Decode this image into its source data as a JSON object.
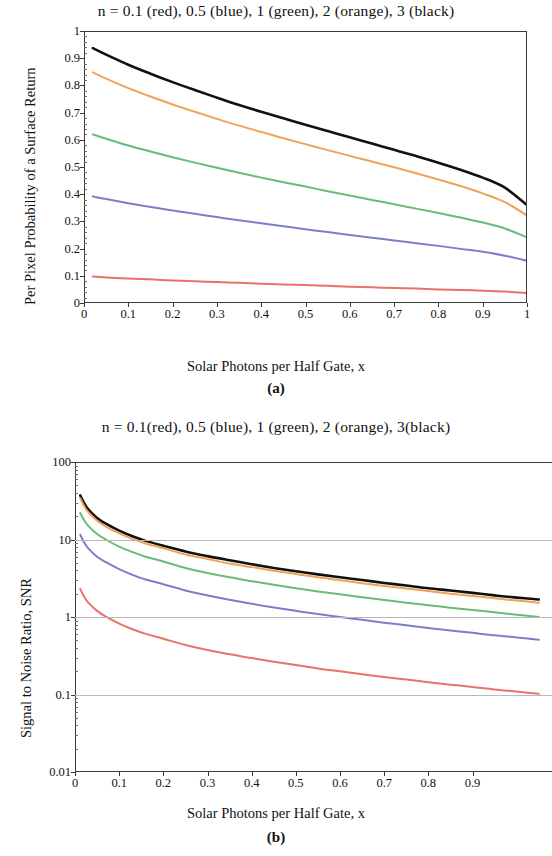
{
  "figure": {
    "panel_a": {
      "title": "n = 0.1 (red), 0.5 (blue), 1 (green), 2 (orange), 3 (black)",
      "ylabel": "Per Pixel Probability of a Surface Return",
      "xlabel": "Solar Photons per Half Gate, x",
      "caption": "(a)"
    },
    "panel_b": {
      "title": "n = 0.1(red), 0.5 (blue), 1 (green), 2 (orange), 3(black)",
      "ylabel": "Signal to Noise Ratio, SNR",
      "xlabel": "Solar Photons per Half Gate, x",
      "caption": "(b)"
    }
  },
  "colors": {
    "red": "#e8736a",
    "blue": "#7b7fc9",
    "green": "#6aba7a",
    "orange": "#f0a259",
    "black": "#111111",
    "axis": "#3a3a3a",
    "grid": "#b9b9b9"
  },
  "chart_data": [
    {
      "id": "panel-a",
      "type": "line",
      "title": "n = 0.1 (red), 0.5 (blue), 1 (green), 2 (orange), 3 (black)",
      "xlabel": "Solar Photons per Half Gate, x",
      "ylabel": "Per Pixel Probability of a Surface Return",
      "xlim": [
        0,
        1
      ],
      "ylim": [
        0,
        1
      ],
      "xscale": "linear",
      "yscale": "linear",
      "grid": false,
      "legend_position": "title",
      "xticks": [
        0,
        0.1,
        0.2,
        0.3,
        0.4,
        0.5,
        0.6,
        0.7,
        0.8,
        0.9,
        1
      ],
      "xticklabels": [
        "0",
        "0.1",
        "0.2",
        "0.3",
        "0.4",
        "0.5",
        "0.6",
        "0.7",
        "0.8",
        "0.9",
        "1"
      ],
      "yticks": [
        0,
        0.1,
        0.2,
        0.3,
        0.4,
        0.5,
        0.6,
        0.7,
        0.8,
        0.9,
        1
      ],
      "yticklabels": [
        "0",
        "0.1",
        "0.2",
        "0.3",
        "0.4",
        "0.5",
        "0.6",
        "0.7",
        "0.8",
        "0.9",
        "1"
      ],
      "x": [
        0.02,
        0.05,
        0.1,
        0.15,
        0.2,
        0.25,
        0.3,
        0.35,
        0.4,
        0.45,
        0.5,
        0.55,
        0.6,
        0.65,
        0.7,
        0.75,
        0.8,
        0.85,
        0.9,
        0.95,
        1.0
      ],
      "series": [
        {
          "name": "n = 3 (black)",
          "color": "#111111",
          "values": [
            0.937,
            0.913,
            0.876,
            0.843,
            0.812,
            0.783,
            0.755,
            0.728,
            0.703,
            0.679,
            0.655,
            0.632,
            0.609,
            0.586,
            0.563,
            0.54,
            0.516,
            0.49,
            0.461,
            0.424,
            0.36
          ]
        },
        {
          "name": "n = 2 (orange)",
          "color": "#f0a259",
          "values": [
            0.848,
            0.825,
            0.79,
            0.759,
            0.73,
            0.703,
            0.677,
            0.652,
            0.629,
            0.606,
            0.584,
            0.562,
            0.541,
            0.52,
            0.499,
            0.477,
            0.454,
            0.43,
            0.403,
            0.371,
            0.322
          ]
        },
        {
          "name": "n = 1 (green)",
          "color": "#6aba7a",
          "values": [
            0.62,
            0.604,
            0.579,
            0.557,
            0.536,
            0.516,
            0.497,
            0.479,
            0.461,
            0.444,
            0.428,
            0.411,
            0.395,
            0.379,
            0.363,
            0.347,
            0.331,
            0.314,
            0.296,
            0.274,
            0.241
          ]
        },
        {
          "name": "n = 0.5 (blue)",
          "color": "#7b7fc9",
          "values": [
            0.392,
            0.382,
            0.367,
            0.353,
            0.34,
            0.328,
            0.316,
            0.304,
            0.293,
            0.282,
            0.271,
            0.261,
            0.25,
            0.24,
            0.23,
            0.22,
            0.21,
            0.199,
            0.188,
            0.174,
            0.155
          ]
        },
        {
          "name": "n = 0.1 (red)",
          "color": "#e8736a",
          "values": [
            0.097,
            0.094,
            0.09,
            0.087,
            0.083,
            0.08,
            0.077,
            0.074,
            0.071,
            0.068,
            0.066,
            0.063,
            0.06,
            0.058,
            0.055,
            0.053,
            0.05,
            0.048,
            0.045,
            0.042,
            0.037
          ]
        }
      ]
    },
    {
      "id": "panel-b",
      "type": "line",
      "title": "n = 0.1(red), 0.5 (blue), 1 (green), 2 (orange), 3(black)",
      "xlabel": "Solar Photons per Half Gate, x",
      "ylabel": "Signal to Noise Ratio, SNR",
      "xlim": [
        0,
        1.08
      ],
      "ylim": [
        0.01,
        100
      ],
      "xscale": "linear",
      "yscale": "log",
      "grid": true,
      "legend_position": "title",
      "xticks": [
        0,
        0.1,
        0.2,
        0.3,
        0.4,
        0.5,
        0.6,
        0.7,
        0.8,
        0.9
      ],
      "xticklabels": [
        "0",
        "0.1",
        "0.2",
        "0.3",
        "0.4",
        "0.5",
        "0.6",
        "0.7",
        "0.8",
        "0.9"
      ],
      "yticks": [
        0.01,
        0.1,
        1,
        10,
        100
      ],
      "yticklabels": [
        "0.01",
        "0.1",
        "1",
        "10",
        "100"
      ],
      "x": [
        0.012,
        0.02,
        0.03,
        0.05,
        0.07,
        0.1,
        0.13,
        0.16,
        0.2,
        0.25,
        0.3,
        0.35,
        0.4,
        0.45,
        0.5,
        0.55,
        0.6,
        0.65,
        0.7,
        0.75,
        0.8,
        0.85,
        0.9,
        0.95,
        1.0,
        1.05
      ],
      "series": [
        {
          "name": "n = 3 (black)",
          "color": "#111111",
          "values": [
            37.0,
            30.0,
            24.5,
            19.0,
            16.0,
            13.0,
            11.0,
            9.6,
            8.3,
            7.0,
            6.1,
            5.4,
            4.8,
            4.3,
            3.9,
            3.55,
            3.25,
            3.0,
            2.75,
            2.55,
            2.35,
            2.2,
            2.05,
            1.9,
            1.78,
            1.68
          ]
        },
        {
          "name": "n = 2 (orange)",
          "color": "#f0a259",
          "values": [
            34.0,
            27.5,
            22.5,
            17.5,
            14.7,
            12.0,
            10.2,
            8.9,
            7.7,
            6.4,
            5.6,
            4.9,
            4.4,
            3.95,
            3.6,
            3.25,
            2.98,
            2.73,
            2.52,
            2.33,
            2.16,
            2.0,
            1.87,
            1.74,
            1.63,
            1.53
          ]
        },
        {
          "name": "n = 1 (green)",
          "color": "#6aba7a",
          "values": [
            22.0,
            18.0,
            15.0,
            11.8,
            10.0,
            8.1,
            6.9,
            6.0,
            5.2,
            4.3,
            3.7,
            3.25,
            2.9,
            2.6,
            2.35,
            2.14,
            1.96,
            1.8,
            1.66,
            1.53,
            1.42,
            1.32,
            1.23,
            1.15,
            1.07,
            1.0
          ]
        },
        {
          "name": "n = 0.5 (blue)",
          "color": "#7b7fc9",
          "values": [
            11.5,
            9.3,
            7.7,
            6.0,
            5.1,
            4.15,
            3.5,
            3.05,
            2.65,
            2.2,
            1.9,
            1.67,
            1.48,
            1.33,
            1.2,
            1.09,
            1.0,
            0.92,
            0.845,
            0.78,
            0.72,
            0.67,
            0.625,
            0.58,
            0.545,
            0.51
          ]
        },
        {
          "name": "n = 0.1 (red)",
          "color": "#e8736a",
          "values": [
            2.3,
            1.86,
            1.53,
            1.2,
            1.01,
            0.82,
            0.695,
            0.605,
            0.525,
            0.435,
            0.375,
            0.33,
            0.295,
            0.265,
            0.24,
            0.217,
            0.199,
            0.183,
            0.168,
            0.156,
            0.144,
            0.134,
            0.125,
            0.116,
            0.109,
            0.102
          ]
        }
      ]
    }
  ]
}
